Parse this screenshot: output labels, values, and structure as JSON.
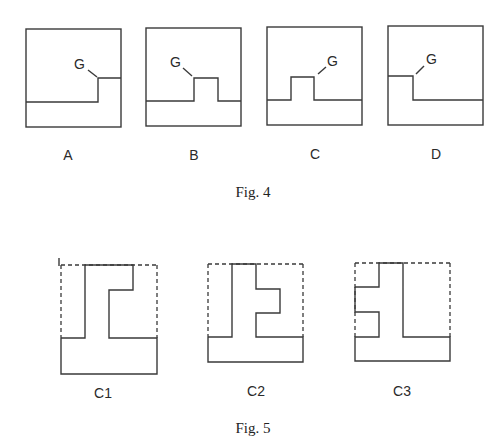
{
  "figures": [
    {
      "caption": "Fig. 4",
      "panels": [
        {
          "label": "A",
          "marker": "G"
        },
        {
          "label": "B",
          "marker": "G"
        },
        {
          "label": "C",
          "marker": "G"
        },
        {
          "label": "D",
          "marker": "G"
        }
      ]
    },
    {
      "caption": "Fig. 5",
      "panels": [
        {
          "label": "C1"
        },
        {
          "label": "C2"
        },
        {
          "label": "C3"
        }
      ]
    }
  ]
}
